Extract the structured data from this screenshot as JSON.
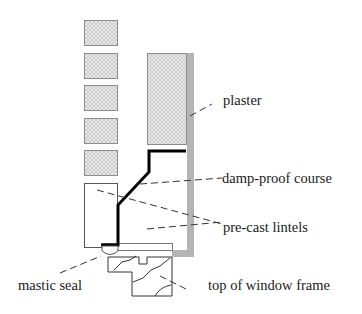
{
  "diagram": {
    "type": "construction-section",
    "labels": {
      "plaster": "plaster",
      "dpc": "damp-proof course",
      "lintels": "pre-cast lintels",
      "mastic": "mastic seal",
      "window": "top of window frame"
    },
    "colors": {
      "brick_fill": "#e4e4e4",
      "brick_stroke": "#8c8c8c",
      "plaster": "#b4b4b4",
      "dpc": "#000000",
      "leader": "#333333",
      "outline": "#555555"
    }
  }
}
